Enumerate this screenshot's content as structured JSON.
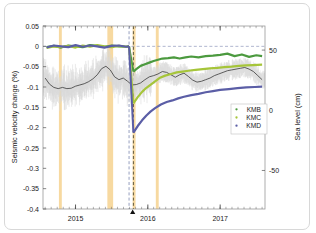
{
  "figure": {
    "caption": ""
  },
  "chart_data": {
    "type": "line",
    "title": "",
    "xlabel": "",
    "ylabel": "Seismic velocity change (%)",
    "y2label": "Sea level (cm)",
    "xlim": [
      2014.55,
      2017.62
    ],
    "ylim": [
      -0.4,
      0.05
    ],
    "y2lim": [
      -82,
      70
    ],
    "grid": false,
    "legend_position": "lower-right",
    "xticks": [
      2015,
      2016,
      2017
    ],
    "xticklabels": [
      "2015",
      "2016",
      "2017"
    ],
    "yticks": [
      0.05,
      0,
      -0.05,
      -0.1,
      -0.15,
      -0.2,
      -0.25,
      -0.3,
      -0.35,
      -0.4
    ],
    "yticklabels": [
      "0.05",
      "0",
      "-0.05",
      "-0.1",
      "-0.15",
      "-0.2",
      "-0.25",
      "-0.3",
      "-0.35",
      "-0.4"
    ],
    "y2ticks": [
      50,
      0,
      -50
    ],
    "y2ticklabels": [
      "50",
      "0",
      "-50"
    ],
    "zero_reference_line": 0,
    "event_marker_x": 2015.79,
    "vertical_dashed_lines": [
      {
        "x": 2015.74,
        "color": "#7b86ad",
        "style": "dashed"
      },
      {
        "x": 2015.8,
        "color": "#3a3a28",
        "style": "dashed"
      }
    ],
    "highlight_bands": [
      {
        "x0": 2014.77,
        "x1": 2014.81,
        "color": "#f7d9a0"
      },
      {
        "x0": 2015.44,
        "x1": 2015.52,
        "color": "#f7d9a0"
      },
      {
        "x0": 2015.79,
        "x1": 2015.83,
        "color": "#f7d9a0"
      },
      {
        "x0": 2016.11,
        "x1": 2016.15,
        "color": "#f7d9a0"
      }
    ],
    "series": [
      {
        "name": "KMB",
        "color": "#4c9a3f",
        "x": [
          2014.6,
          2014.7,
          2014.8,
          2014.9,
          2015.0,
          2015.1,
          2015.2,
          2015.3,
          2015.4,
          2015.5,
          2015.6,
          2015.7,
          2015.74,
          2015.8,
          2015.84,
          2015.9,
          2015.96,
          2016.02,
          2016.08,
          2016.14,
          2016.2,
          2016.28,
          2016.36,
          2016.44,
          2016.52,
          2016.6,
          2016.7,
          2016.8,
          2016.9,
          2017.0,
          2017.1,
          2017.2,
          2017.3,
          2017.4,
          2017.5,
          2017.58
        ],
        "y": [
          -0.002,
          0.001,
          -0.003,
          0.002,
          0.0,
          -0.002,
          0.003,
          0.001,
          -0.001,
          0.002,
          0.0,
          -0.001,
          0.0,
          -0.062,
          -0.056,
          -0.048,
          -0.044,
          -0.04,
          -0.036,
          -0.033,
          -0.03,
          -0.029,
          -0.027,
          -0.03,
          -0.027,
          -0.025,
          -0.027,
          -0.024,
          -0.023,
          -0.021,
          -0.018,
          -0.024,
          -0.02,
          -0.026,
          -0.022,
          -0.024
        ]
      },
      {
        "name": "KMC",
        "color": "#a6c53a",
        "x": [
          2014.6,
          2014.7,
          2014.8,
          2014.9,
          2015.0,
          2015.1,
          2015.2,
          2015.3,
          2015.4,
          2015.5,
          2015.6,
          2015.7,
          2015.74,
          2015.8,
          2015.86,
          2015.92,
          2015.98,
          2016.04,
          2016.1,
          2016.16,
          2016.24,
          2016.32,
          2016.4,
          2016.48,
          2016.56,
          2016.66,
          2016.76,
          2016.86,
          2016.96,
          2017.06,
          2017.16,
          2017.26,
          2017.36,
          2017.46,
          2017.58
        ],
        "y": [
          -0.004,
          0.0,
          -0.002,
          0.001,
          -0.003,
          0.002,
          -0.001,
          0.003,
          0.0,
          -0.002,
          0.001,
          -0.001,
          0.0,
          -0.14,
          -0.125,
          -0.112,
          -0.102,
          -0.094,
          -0.086,
          -0.078,
          -0.072,
          -0.068,
          -0.064,
          -0.062,
          -0.06,
          -0.058,
          -0.056,
          -0.054,
          -0.053,
          -0.051,
          -0.05,
          -0.048,
          -0.047,
          -0.046,
          -0.045
        ]
      },
      {
        "name": "KMD",
        "color": "#5b5ea6",
        "x": [
          2014.6,
          2014.7,
          2014.8,
          2014.9,
          2015.0,
          2015.1,
          2015.2,
          2015.3,
          2015.4,
          2015.5,
          2015.6,
          2015.7,
          2015.74,
          2015.8,
          2015.86,
          2015.92,
          2015.98,
          2016.04,
          2016.1,
          2016.18,
          2016.26,
          2016.34,
          2016.42,
          2016.5,
          2016.6,
          2016.7,
          2016.8,
          2016.9,
          2017.0,
          2017.12,
          2017.24,
          2017.36,
          2017.48,
          2017.58
        ],
        "y": [
          -0.003,
          0.002,
          0.0,
          -0.002,
          0.003,
          -0.001,
          0.002,
          0.0,
          -0.003,
          0.001,
          0.002,
          -0.001,
          0.0,
          -0.212,
          -0.196,
          -0.182,
          -0.17,
          -0.16,
          -0.152,
          -0.143,
          -0.137,
          -0.133,
          -0.128,
          -0.124,
          -0.12,
          -0.117,
          -0.113,
          -0.11,
          -0.107,
          -0.105,
          -0.103,
          -0.101,
          -0.1,
          -0.099
        ]
      }
    ],
    "sea_level_series": {
      "name": "Sea level",
      "color": "#3a3a3a",
      "noise_color": "#d9d9d9",
      "axis": "right",
      "x": [
        2014.58,
        2014.64,
        2014.7,
        2014.76,
        2014.82,
        2014.88,
        2014.94,
        2015.0,
        2015.06,
        2015.12,
        2015.18,
        2015.24,
        2015.3,
        2015.36,
        2015.42,
        2015.48,
        2015.54,
        2015.6,
        2015.66,
        2015.72,
        2015.78,
        2015.84,
        2015.9,
        2015.96,
        2016.02,
        2016.08,
        2016.14,
        2016.2,
        2016.26,
        2016.32,
        2016.38,
        2016.44,
        2016.5,
        2016.56,
        2016.62,
        2016.68,
        2016.74,
        2016.8,
        2016.86,
        2016.92,
        2016.98,
        2017.04,
        2017.1,
        2017.16,
        2017.22,
        2017.28,
        2017.34,
        2017.4,
        2017.46,
        2017.52,
        2017.58
      ],
      "y_left_equiv": [
        -0.078,
        -0.093,
        -0.101,
        -0.104,
        -0.101,
        -0.104,
        -0.103,
        -0.098,
        -0.095,
        -0.092,
        -0.087,
        -0.08,
        -0.07,
        -0.055,
        -0.049,
        -0.058,
        -0.075,
        -0.082,
        -0.078,
        -0.086,
        -0.095,
        -0.094,
        -0.09,
        -0.082,
        -0.075,
        -0.072,
        -0.068,
        -0.062,
        -0.064,
        -0.07,
        -0.076,
        -0.07,
        -0.066,
        -0.074,
        -0.083,
        -0.088,
        -0.086,
        -0.082,
        -0.078,
        -0.072,
        -0.068,
        -0.064,
        -0.06,
        -0.058,
        -0.056,
        -0.054,
        -0.052,
        -0.056,
        -0.062,
        -0.072,
        -0.082
      ]
    }
  }
}
